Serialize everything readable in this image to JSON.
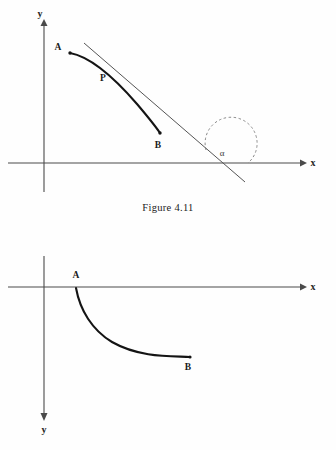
{
  "document": {
    "background_color": "#fefefe",
    "ink_color": "#1a1a1a"
  },
  "figures": [
    {
      "id": "figure-4-11",
      "caption": "Figure 4.11",
      "axes": {
        "x_label": "x",
        "y_label": "y",
        "y_direction": "up",
        "origin": {
          "x": 44,
          "y": 163
        }
      },
      "points": [
        {
          "name": "A",
          "label": "A",
          "x": 70,
          "y": 53
        },
        {
          "name": "P",
          "label": "P",
          "x": 112,
          "y": 74
        },
        {
          "name": "B",
          "label": "B",
          "x": 160,
          "y": 133
        }
      ],
      "angle": {
        "label": "α",
        "vertex_x": 222,
        "vertex_y": 163,
        "arc_style": "dashed",
        "description": "angle between tangent line and positive x-axis"
      },
      "elements": [
        "curve AB",
        "tangent line at P",
        "dashed angle arc alpha"
      ]
    },
    {
      "id": "figure-lower",
      "caption": "",
      "axes": {
        "x_label": "x",
        "y_label": "y",
        "y_direction": "down",
        "origin": {
          "x": 44,
          "y": 287
        }
      },
      "points": [
        {
          "name": "A",
          "label": "A",
          "x": 76,
          "y": 288
        },
        {
          "name": "B",
          "label": "B",
          "x": 190,
          "y": 357
        }
      ],
      "elements": [
        "curve AB below x-axis"
      ]
    }
  ],
  "colors": {
    "curve": "#141414",
    "axis": "#4a4a4a",
    "tangent": "#555555",
    "dashed_arc": "#8a8a8a",
    "faded_caption": "#d8d8d8"
  }
}
